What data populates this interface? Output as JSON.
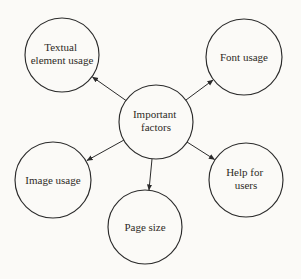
{
  "diagram": {
    "type": "mind-map",
    "colors": {
      "background": "#fbfaf7",
      "stroke": "#2b2b2b",
      "text": "#2e2a26"
    },
    "center": {
      "id": "important-factors",
      "label": "Important factors",
      "lines": [
        "Important",
        "factors"
      ]
    },
    "nodes": [
      {
        "id": "textual-element-usage",
        "label": "Textual element usage",
        "lines": [
          "Textual",
          "element usage"
        ]
      },
      {
        "id": "font-usage",
        "label": "Font usage",
        "lines": [
          "Font usage"
        ]
      },
      {
        "id": "image-usage",
        "label": "Image usage",
        "lines": [
          "Image usage"
        ]
      },
      {
        "id": "help-for-users",
        "label": "Help for users",
        "lines": [
          "Help for",
          "users"
        ]
      },
      {
        "id": "page-size",
        "label": "Page size",
        "lines": [
          "Page size"
        ]
      }
    ],
    "edges": [
      {
        "from": "important-factors",
        "to": "textual-element-usage"
      },
      {
        "from": "important-factors",
        "to": "font-usage"
      },
      {
        "from": "important-factors",
        "to": "image-usage"
      },
      {
        "from": "important-factors",
        "to": "help-for-users"
      },
      {
        "from": "important-factors",
        "to": "page-size"
      }
    ]
  }
}
